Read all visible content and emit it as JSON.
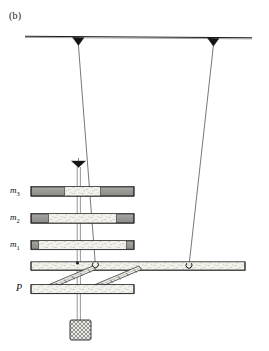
{
  "figure": {
    "panel_label": "(b)",
    "caption_labels": {
      "mass3": "m",
      "mass3_sub": "3",
      "mass2": "m",
      "mass2_sub": "2",
      "mass1": "m",
      "mass1_sub": "1",
      "platform": "P"
    },
    "colors": {
      "stroke": "#1a1a1a",
      "wire": "#555555",
      "bar_fill": "#f0efe9",
      "bar_end_dark": "#9b9b97",
      "bar_end_mid": "#b4b4b0",
      "block_hatch": "#8f8f8f",
      "background": "#ffffff"
    },
    "elements": {
      "support_beam": "horizontal-support-beam",
      "suspension_point_left": "left-suspension-cone",
      "suspension_point_right": "right-suspension-cone",
      "upper_cone": "intermediate-suspension-cone",
      "mass_stack": [
        "m3",
        "m2",
        "m1"
      ],
      "optical_bench": "long-horizontal-bench",
      "diagonal_struts": [
        "strut-left",
        "strut-right"
      ],
      "platform_bar": "platform-P",
      "test_mass_block": "hatched-test-mass"
    },
    "geometry": {
      "support_beam_y": 37,
      "left_suspension_x": 78,
      "right_suspension_x": 213,
      "mass3_y": 191,
      "mass2_y": 218,
      "mass1_y": 245,
      "bench_y": 266,
      "platform_y": 289,
      "block_rect": [
        70,
        320,
        21,
        20
      ]
    }
  }
}
